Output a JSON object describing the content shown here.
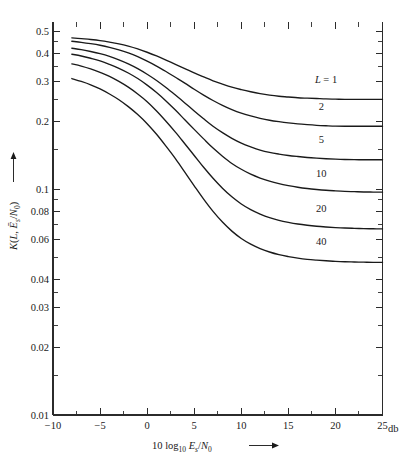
{
  "figure": {
    "background": "#ffffff",
    "ink_color": "#1a1a1a"
  },
  "axes": {
    "x_title_prefix": "10 log",
    "x_title_sub": "10",
    "x_title_main": "E",
    "x_title_main_sub": "s",
    "x_title_slash": "/",
    "x_title_denom": "N",
    "x_title_denom_sub": "0",
    "x_title_arrow": "→",
    "x_unit": "db",
    "y_title_fn": "K",
    "y_title_open": "(",
    "y_title_L": "L",
    "y_title_comma": ", ",
    "y_title_E": "E",
    "y_title_E_sub": "s",
    "y_title_slash": "/",
    "y_title_N": "N",
    "y_title_N_sub": "0",
    "y_title_close": ")",
    "y_title_arrow": "→",
    "x_tick_labels": [
      "-10",
      "-5",
      "0",
      "5",
      "10",
      "15",
      "20",
      "25"
    ],
    "x_tick_values": [
      -10,
      -5,
      0,
      5,
      10,
      15,
      20,
      25
    ],
    "y_tick_labels": [
      "0.5",
      "0.4",
      "0.3",
      "0.2",
      "0.1",
      "0.08",
      "0.06",
      "0.04",
      "0.03",
      "0.02",
      "0.01"
    ],
    "y_tick_values": [
      0.5,
      0.4,
      0.3,
      0.2,
      0.1,
      0.08,
      0.06,
      0.04,
      0.03,
      0.02,
      0.01
    ],
    "y_minor_values": [
      0.45,
      0.35,
      0.25,
      0.15,
      0.09,
      0.07,
      0.05,
      0.035,
      0.025,
      0.015
    ],
    "x_minor_values": [
      -7.5,
      -2.5,
      2.5,
      7.5,
      12.5,
      17.5,
      22.5
    ]
  },
  "curve_labels": [
    {
      "text_prefix": "L = ",
      "text": "1"
    },
    {
      "text_prefix": "",
      "text": "2"
    },
    {
      "text_prefix": "",
      "text": "5"
    },
    {
      "text_prefix": "",
      "text": "10"
    },
    {
      "text_prefix": "",
      "text": "20"
    },
    {
      "text_prefix": "",
      "text": "40"
    }
  ],
  "chart_data": {
    "type": "line",
    "title": "",
    "xlabel": "10 log10 Es/N0  (db)",
    "ylabel": "K(L, Es/N0)",
    "xlim": [
      -10,
      25
    ],
    "ylim": [
      0.01,
      0.55
    ],
    "yscale": "log",
    "xscale": "linear",
    "grid": false,
    "legend": "inline-labels",
    "x": [
      -8,
      -7,
      -6,
      -5,
      -4,
      -3,
      -2,
      -1,
      0,
      1,
      2,
      3,
      4,
      5,
      6,
      7,
      8,
      9,
      10,
      11,
      12,
      13,
      14,
      15,
      16,
      17,
      18,
      19,
      20,
      21,
      22,
      23,
      24,
      25
    ],
    "series": [
      {
        "name": "L = 1",
        "label": "1",
        "values": [
          0.468,
          0.464,
          0.46,
          0.455,
          0.448,
          0.44,
          0.43,
          0.418,
          0.404,
          0.389,
          0.373,
          0.357,
          0.342,
          0.327,
          0.314,
          0.302,
          0.292,
          0.283,
          0.276,
          0.27,
          0.265,
          0.261,
          0.258,
          0.256,
          0.254,
          0.253,
          0.252,
          0.251,
          0.2505,
          0.25,
          0.25,
          0.25,
          0.25,
          0.25
        ]
      },
      {
        "name": "L = 2",
        "label": "2",
        "values": [
          0.452,
          0.447,
          0.441,
          0.434,
          0.425,
          0.414,
          0.401,
          0.386,
          0.369,
          0.351,
          0.332,
          0.313,
          0.295,
          0.277,
          0.261,
          0.247,
          0.235,
          0.225,
          0.217,
          0.211,
          0.206,
          0.202,
          0.199,
          0.1965,
          0.1945,
          0.193,
          0.1918,
          0.191,
          0.1903,
          0.19,
          0.19,
          0.19,
          0.19,
          0.19
        ]
      },
      {
        "name": "L = 5",
        "label": "5",
        "values": [
          0.421,
          0.415,
          0.407,
          0.398,
          0.387,
          0.374,
          0.359,
          0.342,
          0.323,
          0.303,
          0.282,
          0.261,
          0.241,
          0.222,
          0.205,
          0.19,
          0.178,
          0.168,
          0.16,
          0.154,
          0.149,
          0.1455,
          0.143,
          0.141,
          0.1395,
          0.1382,
          0.1372,
          0.1364,
          0.1358,
          0.1354,
          0.1351,
          0.135,
          0.135,
          0.135
        ]
      },
      {
        "name": "L = 10",
        "label": "10",
        "values": [
          0.396,
          0.389,
          0.38,
          0.37,
          0.357,
          0.343,
          0.327,
          0.309,
          0.289,
          0.268,
          0.246,
          0.224,
          0.203,
          0.184,
          0.167,
          0.152,
          0.14,
          0.13,
          0.1225,
          0.1165,
          0.112,
          0.1085,
          0.1058,
          0.1037,
          0.102,
          0.1007,
          0.0997,
          0.0989,
          0.0983,
          0.0978,
          0.0975,
          0.0972,
          0.0971,
          0.097
        ]
      },
      {
        "name": "L = 20",
        "label": "20",
        "values": [
          0.359,
          0.351,
          0.341,
          0.329,
          0.316,
          0.3,
          0.283,
          0.264,
          0.244,
          0.222,
          0.2,
          0.179,
          0.159,
          0.141,
          0.125,
          0.1118,
          0.101,
          0.0925,
          0.086,
          0.0812,
          0.0776,
          0.0748,
          0.0728,
          0.0713,
          0.0701,
          0.0692,
          0.0685,
          0.068,
          0.0676,
          0.0673,
          0.0671,
          0.0669,
          0.0668,
          0.0667
        ]
      },
      {
        "name": "L = 40",
        "label": "40",
        "values": [
          0.309,
          0.3,
          0.29,
          0.278,
          0.264,
          0.249,
          0.232,
          0.214,
          0.195,
          0.175,
          0.155,
          0.1365,
          0.119,
          0.1035,
          0.0903,
          0.0797,
          0.0715,
          0.0652,
          0.0605,
          0.0571,
          0.0546,
          0.0527,
          0.0513,
          0.0503,
          0.0495,
          0.0489,
          0.0485,
          0.0482,
          0.0479,
          0.0477,
          0.0476,
          0.0475,
          0.0474,
          0.0474
        ]
      }
    ],
    "curve_label_positions": [
      {
        "label": "L = 1",
        "x_db": 19.0,
        "y_val": 0.295
      },
      {
        "label": "2",
        "x_db": 18.5,
        "y_val": 0.225
      },
      {
        "label": "5",
        "x_db": 18.5,
        "y_val": 0.16
      },
      {
        "label": "10",
        "x_db": 18.5,
        "y_val": 0.1135
      },
      {
        "label": "20",
        "x_db": 18.5,
        "y_val": 0.0795
      },
      {
        "label": "40",
        "x_db": 18.5,
        "y_val": 0.0565
      }
    ]
  }
}
